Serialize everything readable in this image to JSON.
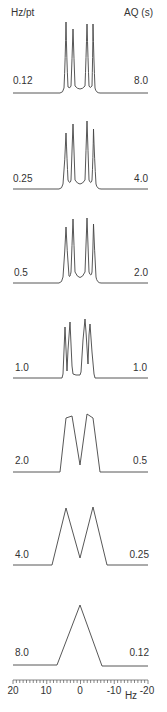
{
  "headers": {
    "left": "Hz/pt",
    "right": "AQ (s)"
  },
  "axis": {
    "label": "Hz",
    "ticks": [
      "20",
      "10",
      "0",
      "-10",
      "-20"
    ],
    "range": [
      20,
      -20
    ]
  },
  "traces": [
    {
      "hz_per_pt": "0.12",
      "aq": "8.0"
    },
    {
      "hz_per_pt": "0.25",
      "aq": "4.0"
    },
    {
      "hz_per_pt": "0.5",
      "aq": "2.0"
    },
    {
      "hz_per_pt": "1.0",
      "aq": "1.0"
    },
    {
      "hz_per_pt": "2.0",
      "aq": "0.5"
    },
    {
      "hz_per_pt": "4.0",
      "aq": "0.25"
    },
    {
      "hz_per_pt": "8.0",
      "aq": "0.12"
    }
  ],
  "chart_data": {
    "type": "line",
    "title": "",
    "xlabel": "Hz",
    "ylabel": "",
    "xlim": [
      20,
      -20
    ],
    "grid": false,
    "legend": "none",
    "x_ticks": [
      20,
      10,
      0,
      -10,
      -20
    ],
    "row_labels_left_title": "Hz/pt",
    "row_labels_right_title": "AQ (s)",
    "series": [
      {
        "name": "0.12 Hz/pt, AQ 8.0 s",
        "hz_per_pt": 0.12,
        "aq_s": 8.0,
        "description": "four resolved sharp lines (quartet-like multiplet)",
        "peaks_hz": [
          4.2,
          2.1,
          -2.1,
          -4.2
        ]
      },
      {
        "name": "0.25 Hz/pt, AQ 4.0 s",
        "hz_per_pt": 0.25,
        "aq_s": 4.0,
        "description": "four resolved lines, slightly broader",
        "peaks_hz": [
          4.2,
          2.1,
          -2.1,
          -4.2
        ]
      },
      {
        "name": "0.5 Hz/pt, AQ 2.0 s",
        "hz_per_pt": 0.5,
        "aq_s": 2.0,
        "description": "four lines, broader",
        "peaks_hz": [
          4.2,
          2.1,
          -2.1,
          -4.2
        ]
      },
      {
        "name": "1.0 Hz/pt, AQ 1.0 s",
        "hz_per_pt": 1.0,
        "aq_s": 1.0,
        "description": "four lines, jagged due to digitization",
        "peaks_hz": [
          4.2,
          2.1,
          -2.1,
          -4.2
        ]
      },
      {
        "name": "2.0 Hz/pt, AQ 0.5 s",
        "hz_per_pt": 2.0,
        "aq_s": 0.5,
        "description": "two broad flat-topped lobes",
        "peaks_hz": [
          3.5,
          -3.5
        ]
      },
      {
        "name": "4.0 Hz/pt, AQ 0.25 s",
        "hz_per_pt": 4.0,
        "aq_s": 0.25,
        "description": "two triangular peaks",
        "peaks_hz": [
          4,
          -4
        ]
      },
      {
        "name": "8.0 Hz/pt, AQ 0.12 s",
        "hz_per_pt": 8.0,
        "aq_s": 0.12,
        "description": "single triangular peak",
        "peaks_hz": [
          0
        ]
      }
    ]
  }
}
